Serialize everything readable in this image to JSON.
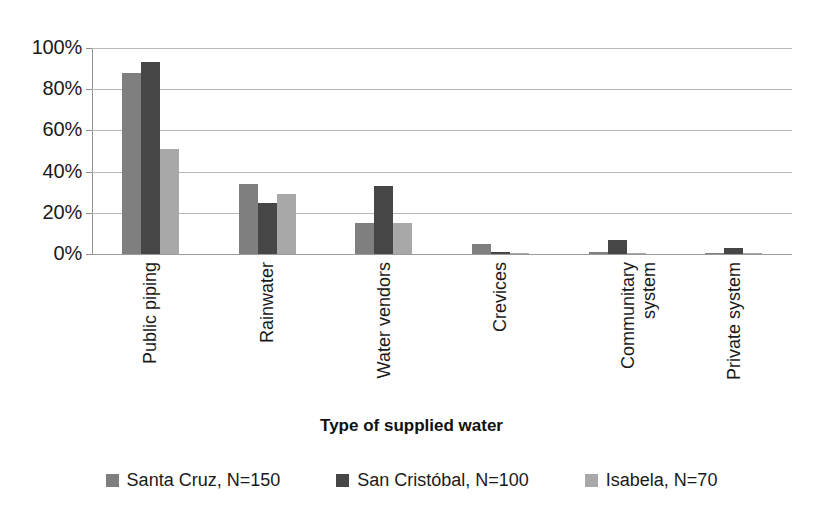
{
  "chart_data": {
    "type": "bar",
    "title": "",
    "xlabel": "Type of supplied water",
    "ylabel": "",
    "ylim": [
      0,
      100
    ],
    "ytick_labels": [
      "100%",
      "80%",
      "60%",
      "40%",
      "20%",
      "0%"
    ],
    "ytick_values": [
      100,
      80,
      60,
      40,
      20,
      0
    ],
    "grid": true,
    "legend_position": "bottom",
    "categories": [
      "Public piping",
      "Rainwater",
      "Water vendors",
      "Crevices",
      "Communitary\nsystem",
      "Private system"
    ],
    "series": [
      {
        "name": "Santa Cruz, N=150",
        "color": "#7f7f7f",
        "values": [
          88,
          34,
          15,
          5,
          1,
          0.5
        ]
      },
      {
        "name": "San Cristóbal, N=100",
        "color": "#464646",
        "values": [
          93,
          25,
          33,
          1,
          7,
          3
        ]
      },
      {
        "name": "Isabela, N=70",
        "color": "#a8a8a8",
        "values": [
          51,
          29,
          15,
          0.5,
          0.5,
          0.5
        ]
      }
    ]
  },
  "colors": {
    "series_1": "#7f7f7f",
    "series_2": "#464646",
    "series_3": "#a8a8a8",
    "gridline": "#b7b7b7",
    "axis": "#8f8f8f",
    "text": "#1a1a1a",
    "background": "#ffffff"
  }
}
